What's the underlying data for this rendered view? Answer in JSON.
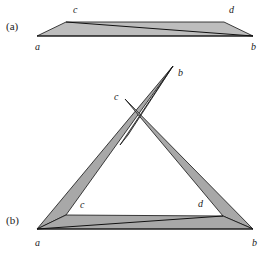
{
  "colors": {
    "fill": "#b8b8b8",
    "fill_dark": "#999999",
    "stroke": "#111111"
  },
  "part_a": {
    "label": "(a)",
    "vertices": {
      "a": "a",
      "b": "b",
      "c": "c",
      "d": "d"
    }
  },
  "part_b": {
    "label": "(b)",
    "vertices": {
      "a": "a",
      "b": "b",
      "c": "c",
      "d": "d",
      "b_top": "b",
      "c_top": "c"
    }
  }
}
